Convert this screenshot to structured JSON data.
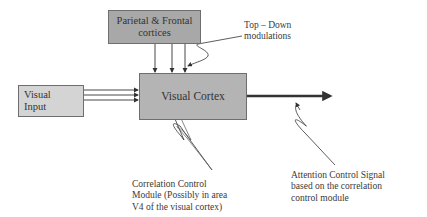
{
  "diagram": {
    "nodes": {
      "parietal": {
        "line1": "Parietal & Frontal",
        "line2": "cortices"
      },
      "visual_cortex": {
        "label": "Visual Cortex"
      },
      "visual_input": {
        "line1": "Visual",
        "line2": "Input"
      }
    },
    "annotations": {
      "top_down": {
        "line1": "Top – Down",
        "line2": "modulations"
      },
      "correlation": {
        "line1": "Correlation Control",
        "line2": "Module (Possibly in area",
        "line3": "V4 of the visual cortex)"
      },
      "attention": {
        "line1": "Attention Control Signal",
        "line2": "based on the correlation",
        "line3": "control module"
      }
    },
    "edges": [
      {
        "from": "parietal",
        "to": "visual_cortex",
        "count": 3
      },
      {
        "from": "visual_input",
        "to": "visual_cortex",
        "count": 3
      },
      {
        "from": "visual_cortex",
        "to": "output",
        "style": "thick"
      }
    ],
    "colors": {
      "parietal_fill": "#a8a8a8",
      "cortex_fill": "#b4b4b4",
      "input_fill": "#d4d4d4",
      "line": "#333333"
    }
  }
}
